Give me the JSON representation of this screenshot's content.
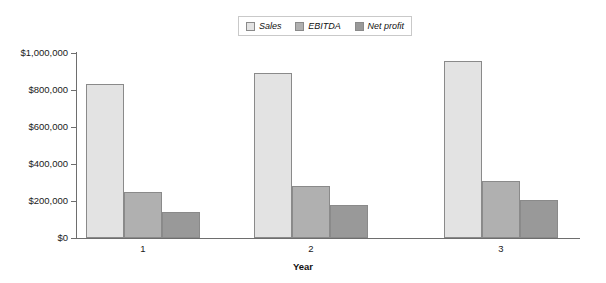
{
  "chart_data": {
    "type": "bar",
    "title": "",
    "xlabel": "Year",
    "ylabel": "",
    "categories": [
      "1",
      "2",
      "3"
    ],
    "series": [
      {
        "name": "Sales",
        "values": [
          835000,
          892000,
          957000
        ],
        "color": "#e3e3e3"
      },
      {
        "name": "EBITDA",
        "values": [
          248000,
          281000,
          308000
        ],
        "color": "#b0b0b0"
      },
      {
        "name": "Net profit",
        "values": [
          140000,
          178000,
          205000
        ],
        "color": "#999999"
      }
    ],
    "ylim": [
      0,
      1000000
    ],
    "yticks": [
      0,
      200000,
      400000,
      600000,
      800000,
      1000000
    ],
    "ytick_labels": [
      "$0",
      "$200,000",
      "$400,000",
      "$600,000",
      "$800,000",
      "$1,000,000"
    ],
    "grid": false,
    "legend_position": "top-center",
    "bar_border_color": "#8a8a8a",
    "axis_color": "#6e6e6e",
    "background": "#ffffff"
  },
  "legend": {
    "items": [
      {
        "label": "Sales"
      },
      {
        "label": "EBITDA"
      },
      {
        "label": "Net profit"
      }
    ]
  },
  "axes": {
    "x_title": "Year"
  }
}
